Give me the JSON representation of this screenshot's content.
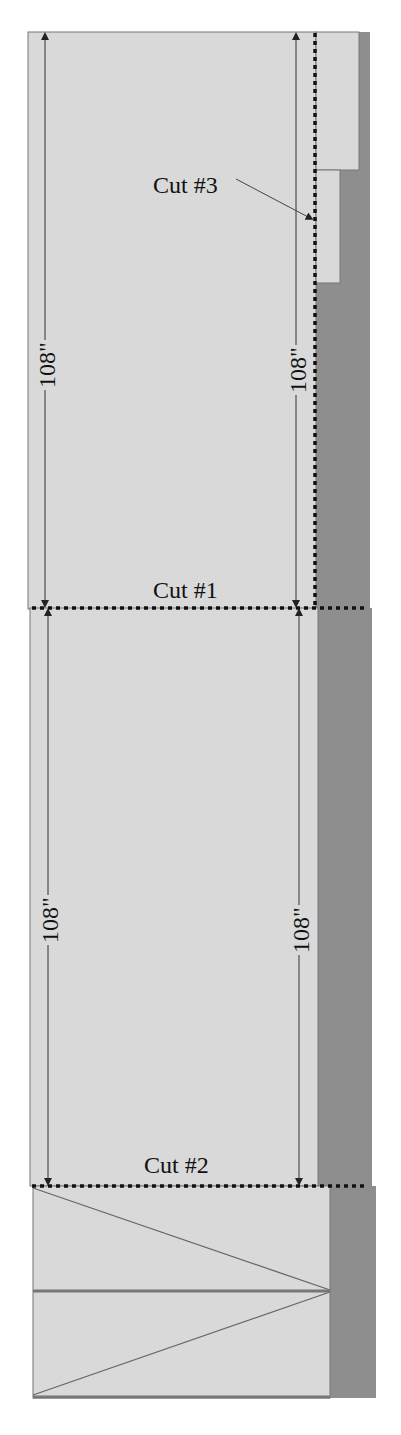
{
  "diagram": {
    "colors": {
      "background": "#ffffff",
      "panel_fill": "#d9d9d9",
      "strip_fill": "#8e8e8e",
      "outline": "#777777",
      "cut_line": "#111111",
      "dimension_line": "#333333"
    },
    "cuts": [
      {
        "id": "cut1",
        "label": "Cut #1"
      },
      {
        "id": "cut2",
        "label": "Cut #2"
      },
      {
        "id": "cut3",
        "label": "Cut #3"
      }
    ],
    "dimensions": {
      "upper_left": "108\"",
      "upper_right": "108\"",
      "lower_left": "108\"",
      "lower_right": "108\""
    }
  }
}
